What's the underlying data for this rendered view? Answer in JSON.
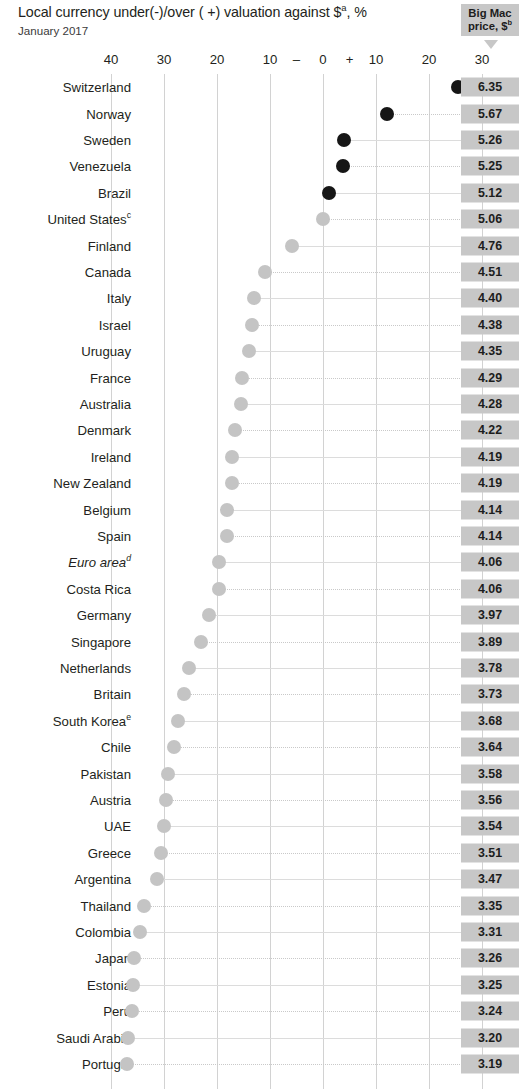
{
  "header": {
    "title_main": "Local currency under(-)/over ( +) valuation against $",
    "title_sup": "a",
    "title_tail": ", %",
    "subtitle": "January 2017",
    "price_header_line1": "Big Mac",
    "price_header_line2": "price, $",
    "price_header_sup": "b"
  },
  "colors": {
    "overvalued_dot": "#161616",
    "undervalued_dot": "#c4c4c4",
    "badge_bg": "#c7c7c7",
    "gridline": "#d2d2d2",
    "text": "#231f20"
  },
  "axis": {
    "ticks": [
      {
        "label": "40",
        "value": -40
      },
      {
        "label": "30",
        "value": -30
      },
      {
        "label": "20",
        "value": -20
      },
      {
        "label": "10",
        "value": -10
      },
      {
        "label": "–",
        "value": -5
      },
      {
        "label": "0",
        "value": 0
      },
      {
        "label": "+",
        "value": 5
      },
      {
        "label": "10",
        "value": 10
      },
      {
        "label": "20",
        "value": 20
      },
      {
        "label": "30",
        "value": 30
      }
    ],
    "gridline_values": [
      -40,
      -30,
      -20,
      -10,
      0,
      10,
      20,
      30
    ]
  },
  "chart_data": {
    "type": "scatter",
    "subtitle": "January 2017",
    "xlabel": "",
    "ylabel": "",
    "xlim": [
      -44,
      32
    ],
    "grid": true,
    "legend": "none",
    "series_note": "Black dots = currency overvalued vs $; grey dots = undervalued vs $",
    "columns": [
      "Country",
      "Valuation vs $ (%)",
      "Big Mac price, $"
    ],
    "categories": [
      "Switzerland",
      "Norway",
      "Sweden",
      "Venezuela",
      "Brazil",
      "United States",
      "Finland",
      "Canada",
      "Italy",
      "Israel",
      "Uruguay",
      "France",
      "Australia",
      "Denmark",
      "Ireland",
      "New Zealand",
      "Belgium",
      "Spain",
      "Euro area",
      "Costa Rica",
      "Germany",
      "Singapore",
      "Netherlands",
      "Britain",
      "South Korea",
      "Chile",
      "Pakistan",
      "Austria",
      "UAE",
      "Greece",
      "Argentina",
      "Thailand",
      "Colombia",
      "Japan",
      "Estonia",
      "Peru",
      "Saudi Arabia",
      "Portugal"
    ],
    "values": [
      25.5,
      12.0,
      3.9,
      3.8,
      1.2,
      0.0,
      -5.9,
      -10.9,
      -13.0,
      -13.4,
      -14.0,
      -15.2,
      -15.4,
      -16.6,
      -17.2,
      -17.2,
      -18.2,
      -18.2,
      -19.7,
      -19.7,
      -21.5,
      -23.1,
      -25.3,
      -26.3,
      -27.3,
      -28.1,
      -29.2,
      -29.6,
      -30.0,
      -30.6,
      -31.4,
      -33.8,
      -34.6,
      -35.6,
      -35.8,
      -36.0,
      -36.8,
      -36.9
    ],
    "prices": [
      6.35,
      5.67,
      5.26,
      5.25,
      5.12,
      5.06,
      4.76,
      4.51,
      4.4,
      4.38,
      4.35,
      4.29,
      4.28,
      4.22,
      4.19,
      4.19,
      4.14,
      4.14,
      4.06,
      4.06,
      3.97,
      3.89,
      3.78,
      3.73,
      3.68,
      3.64,
      3.58,
      3.56,
      3.54,
      3.51,
      3.47,
      3.35,
      3.31,
      3.26,
      3.25,
      3.24,
      3.2,
      3.19
    ]
  },
  "rows": [
    {
      "country": "Switzerland",
      "sup": "",
      "italic": false,
      "value": 25.5,
      "price": "6.35"
    },
    {
      "country": "Norway",
      "sup": "",
      "italic": false,
      "value": 12.0,
      "price": "5.67"
    },
    {
      "country": "Sweden",
      "sup": "",
      "italic": false,
      "value": 3.9,
      "price": "5.26"
    },
    {
      "country": "Venezuela",
      "sup": "",
      "italic": false,
      "value": 3.8,
      "price": "5.25"
    },
    {
      "country": "Brazil",
      "sup": "",
      "italic": false,
      "value": 1.2,
      "price": "5.12"
    },
    {
      "country": "United States",
      "sup": "c",
      "italic": false,
      "value": 0.0,
      "price": "5.06"
    },
    {
      "country": "Finland",
      "sup": "",
      "italic": false,
      "value": -5.9,
      "price": "4.76"
    },
    {
      "country": "Canada",
      "sup": "",
      "italic": false,
      "value": -10.9,
      "price": "4.51"
    },
    {
      "country": "Italy",
      "sup": "",
      "italic": false,
      "value": -13.0,
      "price": "4.40"
    },
    {
      "country": "Israel",
      "sup": "",
      "italic": false,
      "value": -13.4,
      "price": "4.38"
    },
    {
      "country": "Uruguay",
      "sup": "",
      "italic": false,
      "value": -14.0,
      "price": "4.35"
    },
    {
      "country": "France",
      "sup": "",
      "italic": false,
      "value": -15.2,
      "price": "4.29"
    },
    {
      "country": "Australia",
      "sup": "",
      "italic": false,
      "value": -15.4,
      "price": "4.28"
    },
    {
      "country": "Denmark",
      "sup": "",
      "italic": false,
      "value": -16.6,
      "price": "4.22"
    },
    {
      "country": "Ireland",
      "sup": "",
      "italic": false,
      "value": -17.2,
      "price": "4.19"
    },
    {
      "country": "New Zealand",
      "sup": "",
      "italic": false,
      "value": -17.2,
      "price": "4.19"
    },
    {
      "country": "Belgium",
      "sup": "",
      "italic": false,
      "value": -18.2,
      "price": "4.14"
    },
    {
      "country": "Spain",
      "sup": "",
      "italic": false,
      "value": -18.2,
      "price": "4.14"
    },
    {
      "country": "Euro area",
      "sup": "d",
      "italic": true,
      "value": -19.7,
      "price": "4.06"
    },
    {
      "country": "Costa Rica",
      "sup": "",
      "italic": false,
      "value": -19.7,
      "price": "4.06"
    },
    {
      "country": "Germany",
      "sup": "",
      "italic": false,
      "value": -21.5,
      "price": "3.97"
    },
    {
      "country": "Singapore",
      "sup": "",
      "italic": false,
      "value": -23.1,
      "price": "3.89"
    },
    {
      "country": "Netherlands",
      "sup": "",
      "italic": false,
      "value": -25.3,
      "price": "3.78"
    },
    {
      "country": "Britain",
      "sup": "",
      "italic": false,
      "value": -26.3,
      "price": "3.73"
    },
    {
      "country": "South Korea",
      "sup": "e",
      "italic": false,
      "value": -27.3,
      "price": "3.68"
    },
    {
      "country": "Chile",
      "sup": "",
      "italic": false,
      "value": -28.1,
      "price": "3.64"
    },
    {
      "country": "Pakistan",
      "sup": "",
      "italic": false,
      "value": -29.2,
      "price": "3.58"
    },
    {
      "country": "Austria",
      "sup": "",
      "italic": false,
      "value": -29.6,
      "price": "3.56"
    },
    {
      "country": "UAE",
      "sup": "",
      "italic": false,
      "value": -30.0,
      "price": "3.54"
    },
    {
      "country": "Greece",
      "sup": "",
      "italic": false,
      "value": -30.6,
      "price": "3.51"
    },
    {
      "country": "Argentina",
      "sup": "",
      "italic": false,
      "value": -31.4,
      "price": "3.47"
    },
    {
      "country": "Thailand",
      "sup": "",
      "italic": false,
      "value": -33.8,
      "price": "3.35"
    },
    {
      "country": "Colombia",
      "sup": "",
      "italic": false,
      "value": -34.6,
      "price": "3.31"
    },
    {
      "country": "Japan",
      "sup": "",
      "italic": false,
      "value": -35.6,
      "price": "3.26"
    },
    {
      "country": "Estonia",
      "sup": "",
      "italic": false,
      "value": -35.8,
      "price": "3.25"
    },
    {
      "country": "Peru",
      "sup": "",
      "italic": false,
      "value": -36.0,
      "price": "3.24"
    },
    {
      "country": "Saudi Arabia",
      "sup": "",
      "italic": false,
      "value": -36.8,
      "price": "3.20"
    },
    {
      "country": "Portugal",
      "sup": "",
      "italic": false,
      "value": -36.9,
      "price": "3.19"
    }
  ]
}
